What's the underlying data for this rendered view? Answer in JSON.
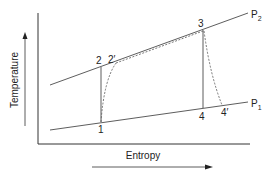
{
  "diagram": {
    "type": "T-s diagram (Brayton cycle)",
    "axes": {
      "y_label": "Temperature",
      "x_label": "Entropy"
    },
    "isobars": [
      {
        "name": "P",
        "subscript": "2",
        "label": "P2"
      },
      {
        "name": "P",
        "subscript": "1",
        "label": "P1"
      }
    ],
    "points": {
      "p1": "1",
      "p2": "2",
      "p2s": "2′",
      "p3": "3",
      "p4": "4",
      "p4s": "4′"
    },
    "colors": {
      "line": "#333333",
      "dashed": "#555555",
      "background": "#ffffff"
    }
  }
}
